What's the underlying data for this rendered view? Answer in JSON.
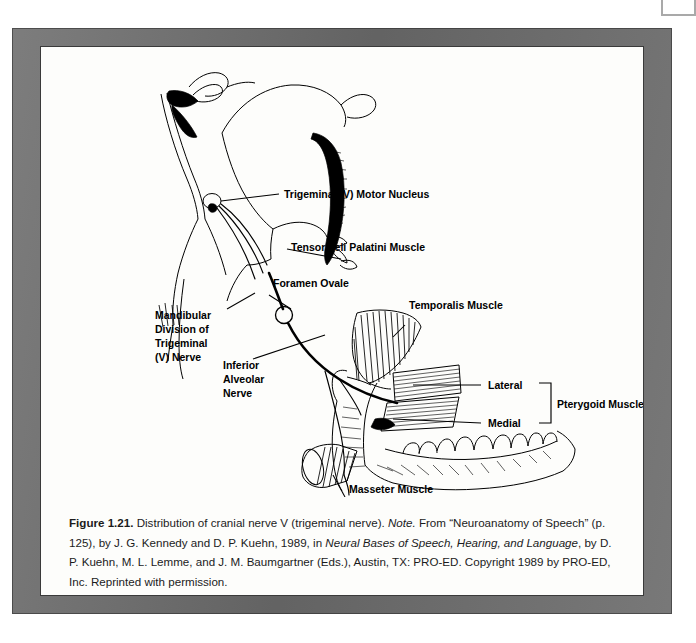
{
  "page": {
    "frame_color": "#6e6e6e",
    "sheet_color": "#fdfdfb",
    "ink_color": "#000000"
  },
  "figure": {
    "title_number": "Figure 1.21.",
    "subject": "Distribution of cranial nerve V (trigeminal nerve)",
    "labels": [
      {
        "id": "trigeminal-motor-nucleus",
        "text": "Trigeminal (V) Motor Nucleus"
      },
      {
        "id": "tensor-veli-palatini-muscle",
        "text": "Tensor Veli Palatini Muscle"
      },
      {
        "id": "foramen-ovale",
        "text": "Foramen Ovale"
      },
      {
        "id": "mandibular-division-line1",
        "text": "Mandibular"
      },
      {
        "id": "mandibular-division-line2",
        "text": "Division of"
      },
      {
        "id": "mandibular-division-line3",
        "text": "Trigeminal"
      },
      {
        "id": "mandibular-division-line4",
        "text": "(V) Nerve"
      },
      {
        "id": "inferior-alveolar-line1",
        "text": "Inferior"
      },
      {
        "id": "inferior-alveolar-line2",
        "text": "Alveolar"
      },
      {
        "id": "inferior-alveolar-line3",
        "text": "Nerve"
      },
      {
        "id": "temporalis-muscle",
        "text": "Temporalis Muscle"
      },
      {
        "id": "lateral",
        "text": "Lateral"
      },
      {
        "id": "medial",
        "text": "Medial"
      },
      {
        "id": "pterygoid-muscles",
        "text": "Pterygoid Muscles"
      },
      {
        "id": "masseter-muscle",
        "text": "Masseter Muscle"
      }
    ]
  },
  "caption": {
    "figure_number": "Figure 1.21.",
    "part1": " Distribution of cranial nerve V (trigeminal nerve). ",
    "note_label": "Note.",
    "part2": " From “Neuroanatomy of Speech” (p. 125), by J. G. Kennedy and D. P. Kuehn, 1989, in ",
    "source_title": "Neural Bases of Speech, Hearing, and Language",
    "part3": ", by D. P. Kuehn, M. L. Lemme, and J. M. Baumgartner (Eds.), Austin, TX: PRO-ED. Copyright 1989 by PRO-ED, Inc. Reprinted with permission."
  }
}
